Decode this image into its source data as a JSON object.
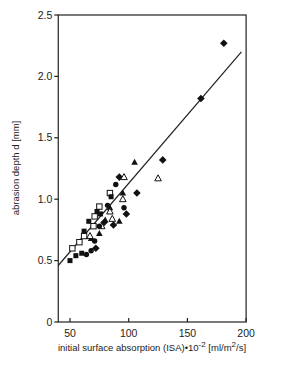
{
  "chart_data": {
    "type": "scatter",
    "title": "",
    "xlabel": "initial surface absorption (ISA)•10⁻² [ml/m²/s]",
    "xlabel_parts": {
      "main": "initial surface absorption (ISA)•10",
      "exp": "-2",
      "unit_pre": " [ml/m",
      "unit_exp": "2",
      "unit_post": "/s]"
    },
    "ylabel": "abrasion depth d [mm]",
    "xlim": [
      40,
      200
    ],
    "ylim": [
      0,
      2.5
    ],
    "xticks": [
      50,
      100,
      150,
      200
    ],
    "yticks": [
      0,
      0.5,
      1.0,
      1.5,
      2.0,
      2.5
    ],
    "ytick_labels": [
      "0",
      "0.5",
      "1.0",
      "1.5",
      "2.0",
      "2.5"
    ],
    "grid": false,
    "legend": null,
    "regression_line": {
      "x": [
        40,
        196
      ],
      "y": [
        0.46,
        2.2
      ]
    },
    "series": [
      {
        "name": "filled diamond",
        "marker": "diamond-filled",
        "points": [
          [
            181,
            2.27
          ],
          [
            161.5,
            1.82
          ],
          [
            129,
            1.32
          ],
          [
            107,
            1.05
          ],
          [
            92,
            1.18
          ],
          [
            79,
            0.81
          ],
          [
            87,
            0.79
          ],
          [
            98,
            0.88
          ],
          [
            72,
            0.6
          ]
        ]
      },
      {
        "name": "filled triangle",
        "marker": "triangle-filled",
        "points": [
          [
            105,
            1.3
          ],
          [
            95,
            1.05
          ],
          [
            84,
            0.93
          ],
          [
            80,
            0.83
          ],
          [
            75,
            0.72
          ],
          [
            68,
            0.68
          ],
          [
            92,
            0.82
          ]
        ]
      },
      {
        "name": "open triangle",
        "marker": "triangle-open",
        "points": [
          [
            96,
            1.18
          ],
          [
            125,
            1.17
          ],
          [
            95,
            1.0
          ],
          [
            84,
            0.9
          ],
          [
            77,
            0.78
          ],
          [
            67,
            0.7
          ],
          [
            86,
            0.84
          ]
        ]
      },
      {
        "name": "filled circle",
        "marker": "circle-filled",
        "points": [
          [
            89,
            1.12
          ],
          [
            96,
            0.93
          ],
          [
            82,
            0.95
          ],
          [
            75,
            0.78
          ],
          [
            71,
            0.66
          ],
          [
            68,
            0.58
          ],
          [
            64,
            0.55
          ]
        ]
      },
      {
        "name": "open square",
        "marker": "square-open",
        "points": [
          [
            84,
            1.05
          ],
          [
            75,
            0.94
          ],
          [
            71,
            0.86
          ],
          [
            70,
            0.78
          ],
          [
            62,
            0.7
          ],
          [
            58,
            0.65
          ],
          [
            52,
            0.6
          ]
        ]
      },
      {
        "name": "filled square",
        "marker": "square-filled",
        "points": [
          [
            85,
            1.02
          ],
          [
            76,
            0.88
          ],
          [
            66,
            0.82
          ],
          [
            62,
            0.74
          ],
          [
            60,
            0.56
          ],
          [
            55,
            0.54
          ],
          [
            50,
            0.5
          ],
          [
            73,
            0.9
          ]
        ]
      }
    ]
  }
}
